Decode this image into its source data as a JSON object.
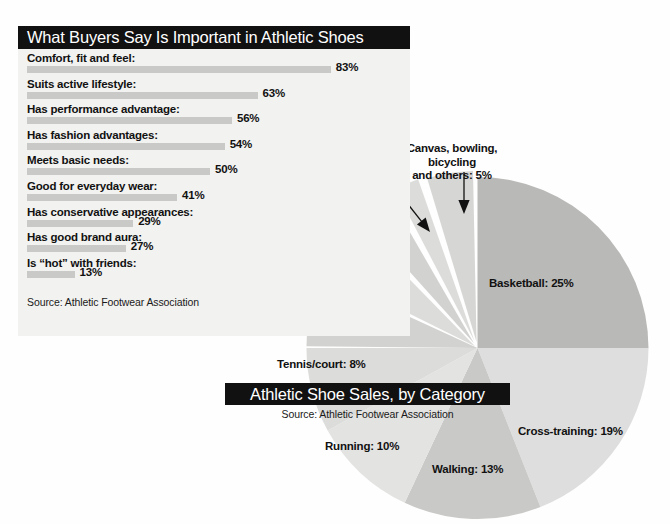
{
  "bar_panel": {
    "title": "What Buyers Say Is Important in Athletic Shoes",
    "source": "Source: Athletic Footwear Association"
  },
  "pie_panel": {
    "title": "Athletic Shoe Sales, by Category",
    "source": "Source: Athletic Footwear Association"
  },
  "chart_data": [
    {
      "type": "bar",
      "title": "What Buyers Say Is Important in Athletic Shoes",
      "orientation": "horizontal",
      "xlabel": "",
      "ylabel": "",
      "xlim": [
        0,
        100
      ],
      "grid": false,
      "legend": "none",
      "source": "Source: Athletic Footwear Association",
      "categories": [
        "Comfort, fit and feel:",
        "Suits active lifestyle:",
        "Has performance advantage:",
        "Has fashion advantages:",
        "Meets basic needs:",
        "Good for everyday wear:",
        "Has conservative appearances:",
        "Has good brand aura:",
        "Is “hot” with friends:"
      ],
      "values": [
        83,
        63,
        56,
        54,
        50,
        41,
        29,
        27,
        13
      ],
      "value_labels": [
        "83%",
        "63%",
        "56%",
        "54%",
        "50%",
        "41%",
        "29%",
        "27%",
        "13%"
      ],
      "bar_color": "#c9c9c7"
    },
    {
      "type": "pie",
      "title": "Athletic Shoe Sales, by Category",
      "source": "Source: Athletic Footwear Association",
      "legend": "labels-around-pie",
      "start_angle_deg": 0,
      "direction": "clockwise",
      "labels": [
        "Basketball",
        "Cross-training",
        "Walking",
        "Running",
        "Tennis/court",
        "Hiking/outdoor",
        "Aerobic",
        "Cleated",
        "Golf",
        "Canvas, bowling, bicycling and others"
      ],
      "values": [
        25,
        19,
        13,
        10,
        8,
        7,
        6,
        4,
        3,
        5
      ],
      "value_labels": [
        "25%",
        "19%",
        "13%",
        "10%",
        "8%",
        "7%",
        "6%",
        "4%",
        "3%",
        "5%"
      ],
      "slice_colors": [
        "#b9b9b7",
        "#dedede",
        "#c9c9c7",
        "#e3e3e1",
        "#dcdcda",
        "#d2d2d0",
        "#dcdcda",
        "#d2d2d0",
        "#dcdcda",
        "#d6d6d4"
      ]
    }
  ],
  "pie_labels": [
    {
      "text": "Basketball: 25%",
      "left": 489,
      "top": 277
    },
    {
      "text": "Cross-training: 19%",
      "left": 518,
      "top": 425
    },
    {
      "text": "Walking: 13%",
      "left": 432,
      "top": 463
    },
    {
      "text": "Running: 10%",
      "left": 325,
      "top": 440
    },
    {
      "text": "Tennis/court: 8%",
      "left": 277,
      "top": 358
    },
    {
      "text": "Hiking/outdoor: 7%",
      "left": 283,
      "top": 313
    },
    {
      "text": "Aerobic: 6%",
      "left": 305,
      "top": 250
    },
    {
      "text": "Cleated: 4%",
      "left": 299,
      "top": 212
    },
    {
      "text": "Golf: 3%",
      "left": 355,
      "top": 188
    }
  ],
  "pie_label_multiline": {
    "line1": "Canvas, bowling,",
    "line2": "bicycling",
    "line3": "and others: 5%",
    "left": 389,
    "top": 142,
    "width": 126
  }
}
